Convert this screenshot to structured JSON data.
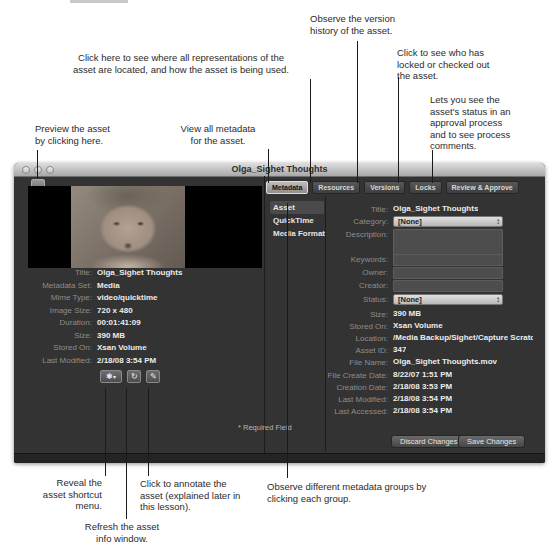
{
  "callouts": {
    "version_history": "Observe the version\nhistory of the asset.",
    "representations": "Click here to see where all representations of the\nasset are located, and how the asset is being used.",
    "locks": "Click to see who has\nlocked or checked out\nthe asset.",
    "review_approve": "Lets you see the\nasset's status in an\napproval process\nand to see process\ncomments.",
    "preview": "Preview the asset\nby clicking here.",
    "view_metadata": "View all metadata\nfor the asset.",
    "shortcut_menu": "Reveal the\nasset shortcut\nmenu.",
    "refresh": "Refresh the asset\ninfo window.",
    "annotate": "Click to annotate the\nasset (explained later in\nthis lesson).",
    "metadata_groups": "Observe different metadata groups by\nclicking each group."
  },
  "window": {
    "title": "Olga_Sighet Thoughts",
    "tabs": [
      {
        "label": "Metadata",
        "selected": true
      },
      {
        "label": "Resources",
        "selected": false
      },
      {
        "label": "Versions",
        "selected": false
      },
      {
        "label": "Locks",
        "selected": false
      },
      {
        "label": "Review & Approve",
        "selected": false
      }
    ],
    "groups": {
      "items": [
        "Asset",
        "QuickTime",
        "Media Format"
      ],
      "selected": "Asset"
    },
    "preview_info": [
      {
        "label": "Title:",
        "value": "Olga_Sighet Thoughts"
      },
      {
        "label": "Metadata Set:",
        "value": "Media"
      },
      {
        "label": "Mime Type:",
        "value": "video/quicktime"
      },
      {
        "label": "Image Size:",
        "value": "720 x 480"
      },
      {
        "label": "Duration:",
        "value": "00:01:41:09"
      },
      {
        "label": "Size:",
        "value": "390 MB"
      },
      {
        "label": "Stored On:",
        "value": "Xsan Volume"
      },
      {
        "label": "Last Modified:",
        "value": "2/18/08 3:54 PM"
      }
    ],
    "form": {
      "rows": [
        {
          "label": "Title:",
          "value": "Olga_Sighet Thoughts"
        },
        {
          "label": "Category:",
          "value": "[None]"
        },
        {
          "label": "Description:",
          "value": ""
        },
        {
          "label": "Keywords:",
          "value": ""
        },
        {
          "label": "Owner:",
          "value": ""
        },
        {
          "label": "Creator:",
          "value": ""
        },
        {
          "label": "Status:",
          "value": "[None]"
        },
        {
          "label": "Size:",
          "value": "390 MB"
        },
        {
          "label": "Stored On:",
          "value": "Xsan Volume"
        },
        {
          "label": "Location:",
          "value": "/Media Backup/Sighet/Capture Scratc"
        },
        {
          "label": "Asset ID:",
          "value": "347"
        },
        {
          "label": "File Name:",
          "value": "Olga_Sighet Thoughts.mov"
        },
        {
          "label": "File Create Date:",
          "value": "8/22/07 1:51 PM"
        },
        {
          "label": "Creation Date:",
          "value": "2/18/08 3:53 PM"
        },
        {
          "label": "Last Modified:",
          "value": "2/18/08 3:54 PM"
        },
        {
          "label": "Last Accessed:",
          "value": "2/18/08 3:54 PM"
        }
      ],
      "required_note": "* Required Field"
    },
    "actions": {
      "discard": "Discard Changes",
      "save": "Save Changes"
    },
    "icons": {
      "gear": "✱",
      "gear_arrow": "▾",
      "refresh": "↻",
      "annotate": "✎",
      "popup_stepper": "↕"
    },
    "colors": {
      "window_bg": "#333333",
      "titlebar": "#c8c8c8",
      "panel_black": "#000000",
      "field_light": "#d4d4d4",
      "value_text": "#ececec",
      "label_text": "#8d8d8d"
    }
  }
}
